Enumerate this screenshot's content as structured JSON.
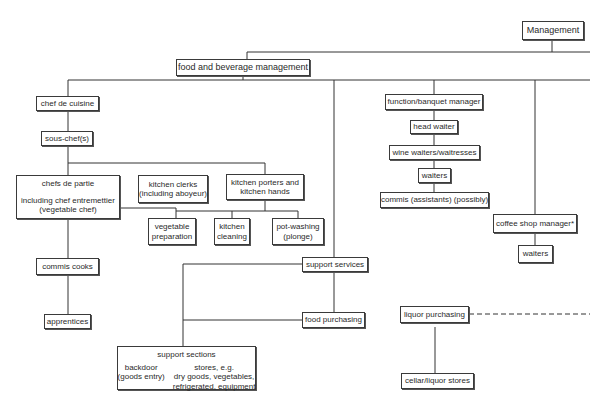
{
  "diagram": {
    "type": "organization-chart",
    "nodes": {
      "management": "Management",
      "fb_management": "food and beverage management",
      "chef_de_cuisine": "chef de cuisine",
      "sous_chef": "sous-chef(s)",
      "chefs_de_partie": {
        "line1": "chefs de partie",
        "line2": "including chef entremettier",
        "line3": "(vegetable chef)"
      },
      "kitchen_clerks": {
        "line1": "kitchen clerks",
        "line2": "(including aboyeur)"
      },
      "kitchen_porters": {
        "line1": "kitchen porters and",
        "line2": "kitchen hands"
      },
      "vegetable_preparation": {
        "line1": "vegetable",
        "line2": "preparation"
      },
      "kitchen_cleaning": {
        "line1": "kitchen",
        "line2": "cleaning"
      },
      "pot_washing": {
        "line1": "pot-washing",
        "line2": "(plonge)"
      },
      "commis_cooks": "commis cooks",
      "apprentices": "apprentices",
      "support_services": "support services",
      "food_purchasing": "food purchasing",
      "support_sections": {
        "title": "support sections",
        "backdoor_line1": "backdoor",
        "backdoor_line2": "(goods entry)",
        "stores_line1": "stores, e.g.",
        "stores_line2": "dry goods, vegetables,",
        "stores_line3": "refrigerated, equipment"
      },
      "function_banquet_manager": "function/banquet manager",
      "head_waiter": "head waiter",
      "wine_waiters": "wine waiters/waitresses",
      "waiters_fb": "waiters",
      "commis_assistants": "commis (assistants) (possibly)",
      "coffee_shop_manager": "coffee shop manager*",
      "waiters_coffee": "waiters",
      "liquor_purchasing": "liquor purchasing",
      "cellar_liquor_stores": "cellar/liquor stores"
    }
  }
}
